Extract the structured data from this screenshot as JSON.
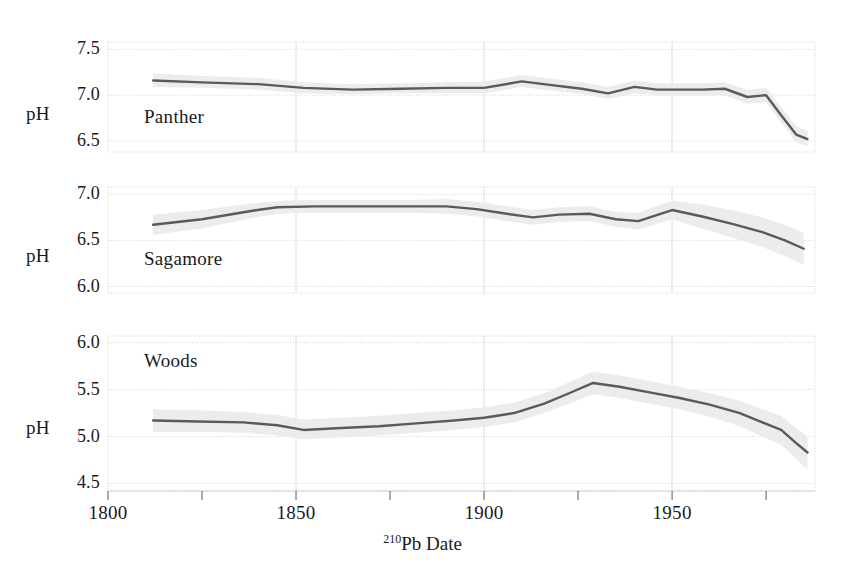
{
  "chart_data": {
    "type": "line",
    "title": "",
    "xlabel": "210Pb Date",
    "xlabel_sup": "210",
    "xlabel_rest": "Pb Date",
    "ylabel": "pH",
    "xlim": [
      1800,
      1988
    ],
    "xticks": [
      1800,
      1850,
      1900,
      1950
    ],
    "xticklabels": [
      "1800",
      "1850",
      "1900",
      "1950"
    ],
    "xminorticks": [
      1825,
      1875,
      1925,
      1975
    ],
    "grid": true,
    "legend": "none",
    "band_label": "confidence interval",
    "line_color": "#5a5a5a",
    "band_color": "#ececec",
    "grid_color": "#c8c8c8",
    "panels": [
      {
        "name": "Panther",
        "ylim": [
          6.38,
          7.58
        ],
        "yticks": [
          6.5,
          7.0,
          7.5
        ],
        "yticklabels": [
          "6.5",
          "7.0",
          "7.5"
        ],
        "ylabel": "pH",
        "x": [
          1812,
          1825,
          1840,
          1852,
          1865,
          1878,
          1890,
          1900,
          1910,
          1918,
          1926,
          1933,
          1940,
          1946,
          1952,
          1958,
          1964,
          1970,
          1975,
          1979,
          1983,
          1986
        ],
        "y": [
          7.16,
          7.14,
          7.12,
          7.08,
          7.06,
          7.07,
          7.08,
          7.08,
          7.15,
          7.11,
          7.07,
          7.02,
          7.09,
          7.06,
          7.06,
          7.06,
          7.07,
          6.98,
          7.0,
          6.78,
          6.57,
          6.52
        ],
        "y_lower": [
          7.09,
          7.08,
          7.06,
          7.02,
          7.01,
          7.02,
          7.02,
          7.02,
          7.09,
          7.05,
          7.01,
          6.96,
          7.02,
          7.0,
          7.0,
          7.0,
          7.0,
          6.91,
          6.92,
          6.7,
          6.49,
          6.44
        ],
        "y_upper": [
          7.24,
          7.21,
          7.19,
          7.14,
          7.12,
          7.13,
          7.14,
          7.15,
          7.22,
          7.18,
          7.14,
          7.09,
          7.16,
          7.13,
          7.13,
          7.13,
          7.14,
          7.06,
          7.08,
          6.87,
          6.66,
          6.61
        ]
      },
      {
        "name": "Sagamore",
        "ylim": [
          5.93,
          7.08
        ],
        "yticks": [
          6.0,
          6.5,
          7.0
        ],
        "yticklabels": [
          "6.0",
          "6.5",
          "7.0"
        ],
        "ylabel": "pH",
        "x": [
          1812,
          1825,
          1838,
          1845,
          1855,
          1868,
          1880,
          1890,
          1898,
          1906,
          1913,
          1920,
          1928,
          1935,
          1941,
          1950,
          1958,
          1966,
          1974,
          1980,
          1985
        ],
        "y": [
          6.67,
          6.73,
          6.82,
          6.86,
          6.87,
          6.87,
          6.87,
          6.87,
          6.84,
          6.79,
          6.75,
          6.78,
          6.79,
          6.73,
          6.71,
          6.83,
          6.76,
          6.68,
          6.59,
          6.5,
          6.41
        ],
        "y_lower": [
          6.56,
          6.63,
          6.74,
          6.79,
          6.8,
          6.8,
          6.8,
          6.79,
          6.76,
          6.71,
          6.67,
          6.7,
          6.71,
          6.65,
          6.62,
          6.73,
          6.63,
          6.53,
          6.43,
          6.33,
          6.24
        ],
        "y_upper": [
          6.78,
          6.83,
          6.9,
          6.93,
          6.94,
          6.94,
          6.94,
          6.95,
          6.92,
          6.87,
          6.83,
          6.86,
          6.87,
          6.81,
          6.8,
          6.93,
          6.89,
          6.83,
          6.75,
          6.67,
          6.58
        ]
      },
      {
        "name": "Woods",
        "ylim": [
          4.42,
          6.07
        ],
        "yticks": [
          4.5,
          5.0,
          5.5,
          6.0
        ],
        "yticklabels": [
          "4.5",
          "5.0",
          "5.5",
          "6.0"
        ],
        "ylabel": "pH",
        "x": [
          1812,
          1824,
          1836,
          1845,
          1852,
          1862,
          1872,
          1882,
          1892,
          1900,
          1908,
          1916,
          1922,
          1929,
          1936,
          1944,
          1952,
          1960,
          1968,
          1974,
          1979,
          1983,
          1986
        ],
        "y": [
          5.17,
          5.16,
          5.15,
          5.12,
          5.07,
          5.09,
          5.11,
          5.14,
          5.17,
          5.2,
          5.25,
          5.35,
          5.45,
          5.57,
          5.53,
          5.47,
          5.41,
          5.34,
          5.25,
          5.15,
          5.07,
          4.93,
          4.83
        ],
        "y_lower": [
          5.05,
          5.05,
          5.04,
          5.01,
          4.97,
          4.99,
          5.01,
          5.04,
          5.07,
          5.1,
          5.15,
          5.25,
          5.34,
          5.45,
          5.41,
          5.35,
          5.29,
          5.21,
          5.11,
          5.0,
          4.91,
          4.76,
          4.65
        ],
        "y_upper": [
          5.29,
          5.28,
          5.26,
          5.23,
          5.18,
          5.2,
          5.22,
          5.25,
          5.28,
          5.31,
          5.36,
          5.46,
          5.57,
          5.69,
          5.65,
          5.59,
          5.53,
          5.46,
          5.38,
          5.29,
          5.22,
          5.09,
          5.0
        ]
      }
    ]
  }
}
